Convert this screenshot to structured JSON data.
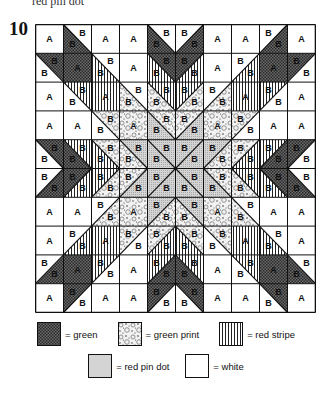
{
  "caption": {
    "top_text": "red pin dot",
    "figure_number": "10"
  },
  "quilt": {
    "grid_size": 10,
    "cell_labels": {
      "a": "A",
      "b": "B"
    },
    "fabrics": {
      "green": "#555555",
      "green_print": "#e6e6e6",
      "red_stripe": "#ffffff",
      "red_pin_dot": "#cfcfcf",
      "white": "#ffffff"
    },
    "quadrant": [
      [
        {
          "type": "A",
          "fill": "white"
        },
        {
          "type": "B",
          "tr": "white",
          "bl": "green"
        },
        {
          "type": "A",
          "fill": "white"
        },
        {
          "type": "A",
          "fill": "white"
        },
        {
          "type": "B",
          "tr": "white",
          "bl": "green"
        }
      ],
      [
        {
          "type": "B",
          "tr": "green",
          "bl": "white"
        },
        {
          "type": "A",
          "fill": "green"
        },
        {
          "type": "B",
          "tr": "white",
          "bl": "stripe"
        },
        {
          "type": "A",
          "fill": "white"
        },
        {
          "type": "B",
          "tr": "green",
          "bl": "stripe"
        }
      ],
      [
        {
          "type": "A",
          "fill": "white"
        },
        {
          "type": "B",
          "tr": "stripe",
          "bl": "white"
        },
        {
          "type": "A",
          "fill": "stripe"
        },
        {
          "type": "B",
          "tr": "white",
          "bl": "print"
        },
        {
          "type": "B",
          "tr": "stripe",
          "bl": "print"
        }
      ],
      [
        {
          "type": "A",
          "fill": "white"
        },
        {
          "type": "A",
          "fill": "white"
        },
        {
          "type": "B",
          "tr": "print",
          "bl": "white"
        },
        {
          "type": "A",
          "fill": "print"
        },
        {
          "type": "B",
          "tr": "print",
          "bl": "pindot"
        }
      ],
      [
        {
          "type": "B",
          "tr": "green",
          "bl": "white"
        },
        {
          "type": "B",
          "tr": "stripe",
          "bl": "green"
        },
        {
          "type": "B",
          "tr": "print",
          "bl": "stripe"
        },
        {
          "type": "B",
          "tr": "pindot",
          "bl": "print"
        },
        {
          "type": "B",
          "tr": "pindot",
          "bl": "pindot"
        }
      ]
    ]
  },
  "legend": {
    "items": [
      {
        "key": "green",
        "label": "= green"
      },
      {
        "key": "print",
        "label": "= green print"
      },
      {
        "key": "stripe",
        "label": "= red stripe"
      },
      {
        "key": "pindot",
        "label": "= red pin dot"
      },
      {
        "key": "white",
        "label": "= white"
      }
    ]
  }
}
